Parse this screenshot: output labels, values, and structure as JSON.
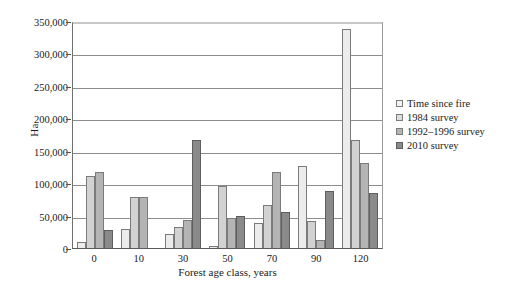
{
  "chart_data": {
    "type": "bar",
    "title": "",
    "xlabel": "Forest age class, years",
    "ylabel": "Ha",
    "categories": [
      "0",
      "10",
      "30",
      "50",
      "70",
      "90",
      "120"
    ],
    "series": [
      {
        "name": "Time since  fire",
        "values": [
          10000,
          30000,
          21000,
          3000,
          39000,
          127000,
          337000
        ]
      },
      {
        "name": "1984 survey",
        "values": [
          111000,
          78000,
          32000,
          96000,
          66000,
          41000,
          166000
        ]
      },
      {
        "name": "1992–1996 survey",
        "values": [
          117000,
          78000,
          43000,
          47000,
          117000,
          13000,
          131000
        ]
      },
      {
        "name": "2010 survey",
        "values": [
          28000,
          0,
          167000,
          50000,
          56000,
          88000,
          85000
        ]
      }
    ],
    "ylim": [
      0,
      350000
    ],
    "y_ticks": [
      "0",
      "50,000",
      "100,000",
      "150,000",
      "200,000",
      "250,000",
      "300,000",
      "350,000"
    ],
    "y_tick_values": [
      0,
      50000,
      100000,
      150000,
      200000,
      250000,
      300000,
      350000
    ],
    "grid": true,
    "legend_position": "right",
    "colors": [
      "#ececec",
      "#d2d2d2",
      "#b4b4b4",
      "#8a8a8a"
    ]
  }
}
